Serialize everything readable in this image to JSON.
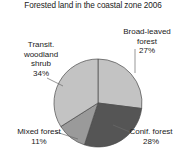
{
  "chart": {
    "title": "Forested land in the coastal zone 2006"
  },
  "chart_data": {
    "type": "pie",
    "title": "Forested land in the coastal zone 2006",
    "subtitle": "",
    "xlabel": "",
    "ylabel": "",
    "legend_position": "none",
    "grid": false,
    "units": "percent",
    "total": 100,
    "start_angle_deg": 0,
    "direction": "clockwise",
    "categories": [
      "Broad-leaved forest",
      "Conif. forest",
      "Mixed forest",
      "Transit. woodland shrub"
    ],
    "values": [
      27,
      28,
      11,
      34
    ],
    "slices": [
      {
        "label": "Broad-leaved forest",
        "label_line_1": "Broad-leaved",
        "label_line_2": "forest",
        "value": 27,
        "value_label": "27%",
        "color": "#c3c3c3",
        "position": "top-right"
      },
      {
        "label": "Conif. forest",
        "label_line_1": "Conif. forest",
        "label_line_2": "",
        "value": 28,
        "value_label": "28%",
        "color": "#555555",
        "position": "bottom-right"
      },
      {
        "label": "Mixed forest",
        "label_line_1": "Mixed forest",
        "label_line_2": "",
        "value": 11,
        "value_label": "11%",
        "color": "#9a9a9a",
        "position": "bottom-left"
      },
      {
        "label": "Transit. woodland shrub",
        "label_line_1": "Transit.",
        "label_line_2": "woodland",
        "label_line_3": "shrub",
        "value": 34,
        "value_label": "34%",
        "color": "#c3c3c3",
        "position": "left"
      }
    ],
    "colors": {
      "broad_leaved": "#c3c3c3",
      "conifer": "#555555",
      "mixed": "#9a9a9a",
      "transitional": "#c3c3c3",
      "slice_border": "#4a4a4a",
      "background": "#ffffff",
      "text": "#1a1a1a",
      "leader_line": "#6a6a6a"
    }
  },
  "labels": {
    "broad_leaved": {
      "line1": "Broad-leaved",
      "line2": "forest",
      "pct": "27%"
    },
    "transitional": {
      "line1": "Transit.",
      "line2": "woodland",
      "line3": "shrub",
      "pct": "34%"
    },
    "mixed": {
      "line1": "Mixed forest",
      "pct": "11%"
    },
    "conifer": {
      "line1": "Conif. forest",
      "pct": "28%"
    }
  }
}
